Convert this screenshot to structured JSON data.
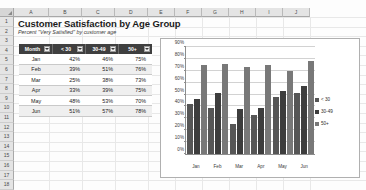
{
  "grid": {
    "columns": [
      "A",
      "B",
      "C",
      "D",
      "E",
      "F",
      "G",
      "H",
      "I",
      "J"
    ],
    "rows": [
      "1",
      "2",
      "3",
      "4",
      "5",
      "6",
      "7",
      "8",
      "9",
      "10",
      "11",
      "12",
      "13",
      "14",
      "15",
      "16",
      "17",
      "18"
    ]
  },
  "sheet": {
    "title": "Customer Satisfaction by Age Group",
    "subtitle": "Percent \"Very Satisfied\" by customer age"
  },
  "table": {
    "headers": [
      "Month",
      "< 30",
      "30-49",
      "50+"
    ],
    "rows": [
      {
        "month": "Jan",
        "u30": "42%",
        "a3049": "46%",
        "a50": "75%"
      },
      {
        "month": "Feb",
        "u30": "39%",
        "a3049": "51%",
        "a50": "76%"
      },
      {
        "month": "Mar",
        "u30": "25%",
        "a3049": "38%",
        "a50": "73%"
      },
      {
        "month": "Apr",
        "u30": "33%",
        "a3049": "39%",
        "a50": "75%"
      },
      {
        "month": "May",
        "u30": "48%",
        "a3049": "53%",
        "a50": "70%"
      },
      {
        "month": "Jun",
        "u30": "51%",
        "a3049": "57%",
        "a50": "78%"
      }
    ]
  },
  "chart_data": {
    "type": "bar",
    "title": "",
    "xlabel": "",
    "ylabel": "",
    "categories": [
      "Jan",
      "Feb",
      "Mar",
      "Apr",
      "May",
      "Jun"
    ],
    "series": [
      {
        "name": "< 30",
        "values": [
          42,
          39,
          25,
          33,
          48,
          51
        ],
        "color": "#565656"
      },
      {
        "name": "30-49",
        "values": [
          46,
          51,
          38,
          39,
          53,
          57
        ],
        "color": "#3d3d3d"
      },
      {
        "name": "50+",
        "values": [
          75,
          76,
          73,
          75,
          70,
          78
        ],
        "color": "#787878"
      }
    ],
    "ylim": [
      0,
      90
    ],
    "yticks": [
      "0%",
      "10%",
      "20%",
      "30%",
      "40%",
      "50%",
      "60%",
      "70%",
      "80%",
      "90%"
    ],
    "ytick_values": [
      0,
      10,
      20,
      30,
      40,
      50,
      60,
      70,
      80,
      90
    ],
    "grid": true,
    "legend_position": "right"
  }
}
